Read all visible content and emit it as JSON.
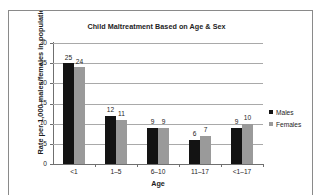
{
  "figure": {
    "border_color": "#8a8a8a",
    "background": "#ffffff"
  },
  "chart_data": {
    "type": "bar",
    "title": "Child Maltreatment Based on Age & Sex",
    "xlabel": "Age",
    "ylabel": "Rate per 1,000 males/females in population",
    "categories": [
      "<1",
      "1–5",
      "6–10",
      "11–17",
      "<1–17"
    ],
    "series": [
      {
        "name": "Males",
        "color": "#131313",
        "values": [
          25,
          12,
          9,
          6,
          9
        ]
      },
      {
        "name": "Females",
        "color": "#9a9a9a",
        "values": [
          24,
          11,
          9,
          7,
          10
        ]
      }
    ],
    "ylim": [
      0,
      30
    ],
    "yticks": [
      0,
      5,
      10,
      15,
      20,
      25,
      30
    ],
    "ytick_labels": [
      "0",
      "5",
      "10",
      "15",
      "20",
      "25",
      "30"
    ],
    "grid": true,
    "grid_axis": "y",
    "grid_color": "#a9a9a9",
    "legend_position": "right",
    "data_labels": true
  }
}
